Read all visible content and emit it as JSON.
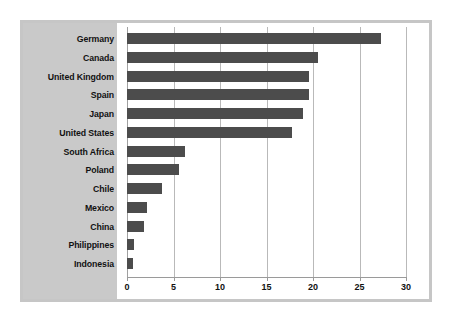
{
  "chart_data": {
    "type": "bar",
    "orientation": "horizontal",
    "title": "",
    "subtitle": "",
    "xlabel": "",
    "ylabel": "",
    "categories": [
      "Germany",
      "Canada",
      "United Kingdom",
      "Spain",
      "Japan",
      "United States",
      "South Africa",
      "Poland",
      "Chile",
      "Mexico",
      "China",
      "Philippines",
      "Indonesia"
    ],
    "values": [
      27.3,
      20.5,
      19.6,
      19.6,
      18.9,
      17.7,
      6.2,
      5.6,
      3.8,
      2.1,
      1.8,
      0.7,
      0.6
    ],
    "xlim": [
      0,
      30
    ],
    "xticks": [
      0,
      5,
      10,
      15,
      20,
      25,
      30
    ],
    "xtick_labels": [
      "0",
      "5",
      "10",
      "15",
      "20",
      "25",
      "30"
    ],
    "grid": "vertical",
    "legend": null,
    "series": [
      {
        "name": "",
        "values": [
          27.3,
          20.5,
          19.6,
          19.6,
          18.9,
          17.7,
          6.2,
          5.6,
          3.8,
          2.1,
          1.8,
          0.7,
          0.6
        ]
      }
    ]
  },
  "colors": {
    "bar": "#4c4c4c",
    "label_panel": "#c9c9c9",
    "frame": "#c6c6c6",
    "gridline": "#b9b9b9",
    "axis": "#9a9a9a",
    "text": "#111111",
    "plot_background": "#ffffff"
  }
}
